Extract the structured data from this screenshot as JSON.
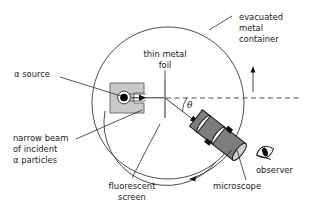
{
  "figure": {
    "type": "schematic-diagram",
    "background_color": "#ffffff",
    "line_color": "#3a3a3a",
    "text_color": "#1a1a1a"
  },
  "labels": {
    "alpha_source": "α source",
    "thin_metal_foil_line1": "thin metal",
    "thin_metal_foil_line2": "foil",
    "evacuated_line1": "evacuated",
    "evacuated_line2": "metal",
    "evacuated_line3": "container",
    "narrow_beam_line1": "narrow beam",
    "narrow_beam_line2": "of incident",
    "narrow_beam_line3": "α particles",
    "fluorescent_line1": "fluorescent",
    "fluorescent_line2": "screen",
    "microscope": "microscope",
    "observer": "observer",
    "scattering_angle": "θ"
  },
  "colors": {
    "source_box_fill": "#c9c9c9",
    "source_box_stroke": "#6e6e6e",
    "source_dot": "#000000",
    "microscope_body": "#808080",
    "microscope_highlight": "#ffffff",
    "microscope_clamp": "#111111",
    "stroke": "#3a3a3a"
  },
  "geometry": {
    "container_circle_center_x": 168,
    "container_circle_center_y": 103,
    "container_circle_radius": 76,
    "beam_axis_y": 98,
    "foil_x": 165
  }
}
